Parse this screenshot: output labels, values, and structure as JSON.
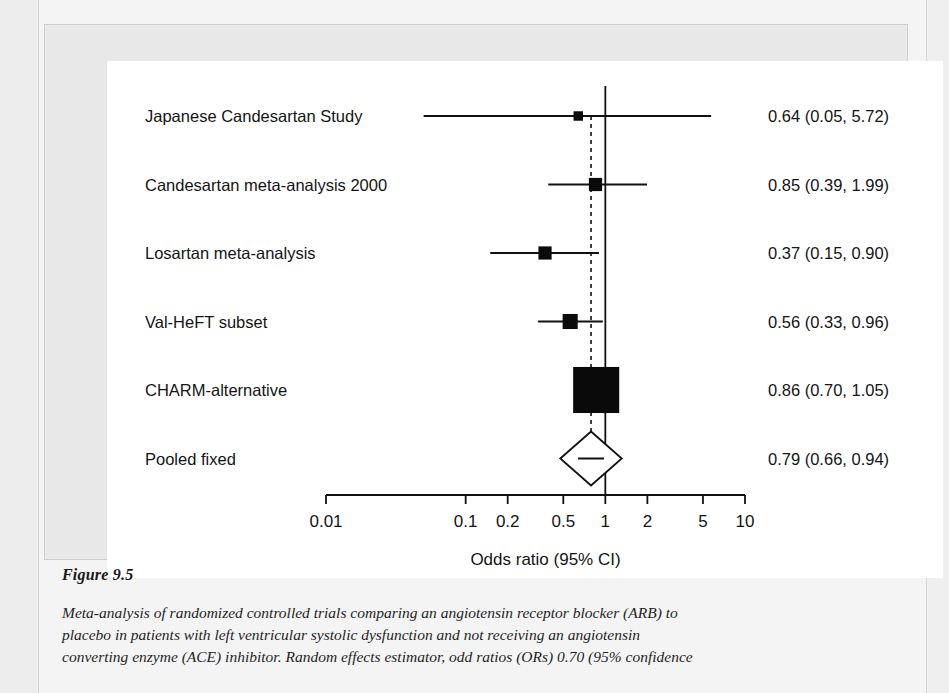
{
  "figure": {
    "number_label": "Figure 9.5",
    "caption_lines": [
      "Meta-analysis of randomized controlled trials comparing an angiotensin receptor blocker (ARB) to",
      "placebo in patients with left ventricular systolic dysfunction and not receiving an angiotensin",
      "converting enzyme (ACE) inhibitor. Random effects estimator, odd ratios (ORs) 0.70 (95% confidence"
    ]
  },
  "chart_data": {
    "type": "forest",
    "title": "",
    "xlabel": "Odds ratio (95% CI)",
    "ylabel": "",
    "scale": "log",
    "xlim": [
      0.01,
      10
    ],
    "grid": false,
    "null_line": 1,
    "pooled_reference_line": 0.79,
    "tick_values": [
      0.01,
      0.1,
      0.2,
      0.5,
      1,
      2,
      5,
      10
    ],
    "tick_labels": [
      "0.01",
      "0.1",
      "0.2",
      "0.5",
      "1",
      "2",
      "5",
      "10"
    ],
    "effect_measure": "Odds ratio",
    "rows": [
      {
        "label": "Japanese Candesartan Study",
        "estimate": 0.64,
        "ci_low": 0.05,
        "ci_high": 5.72,
        "result_text": "0.64 (0.05, 5.72)",
        "weight": 0.04,
        "marker": "square"
      },
      {
        "label": "Candesartan meta-analysis 2000",
        "estimate": 0.85,
        "ci_low": 0.39,
        "ci_high": 1.99,
        "result_text": "0.85 (0.39, 1.99)",
        "weight": 0.1,
        "marker": "square"
      },
      {
        "label": "Losartan meta-analysis",
        "estimate": 0.37,
        "ci_low": 0.15,
        "ci_high": 0.9,
        "result_text": "0.37 (0.15, 0.90)",
        "weight": 0.1,
        "marker": "square"
      },
      {
        "label": "Val-HeFT subset",
        "estimate": 0.56,
        "ci_low": 0.33,
        "ci_high": 0.96,
        "result_text": "0.56 (0.33, 0.96)",
        "weight": 0.13,
        "marker": "square"
      },
      {
        "label": "CHARM-alternative",
        "estimate": 0.86,
        "ci_low": 0.7,
        "ci_high": 1.05,
        "result_text": "0.86 (0.70, 1.05)",
        "weight": 0.63,
        "marker": "square"
      },
      {
        "label": "Pooled fixed",
        "estimate": 0.79,
        "ci_low": 0.66,
        "ci_high": 0.94,
        "result_text": "0.79 (0.66, 0.94)",
        "weight": 1.0,
        "marker": "diamond"
      }
    ]
  }
}
